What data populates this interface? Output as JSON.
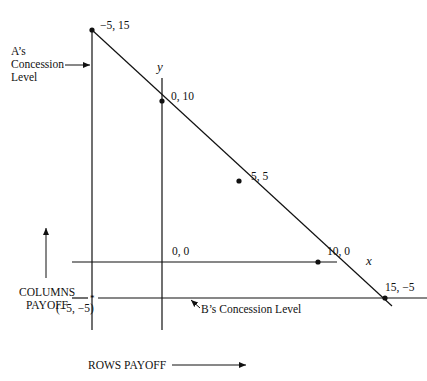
{
  "diagram": {
    "type": "payoff-diagram",
    "axes": {
      "x_label": "x",
      "y_label": "y",
      "horizontal_caption": "ROWS PAYOFF",
      "vertical_caption_line1": "COLUMNS",
      "vertical_caption_line2": "PAYOFF"
    },
    "points": [
      {
        "label": "−5, 15",
        "x": -5,
        "y": 15
      },
      {
        "label": "0, 10",
        "x": 0,
        "y": 10
      },
      {
        "label": "5, 5",
        "x": 5,
        "y": 5
      },
      {
        "label": "10, 0",
        "x": 10,
        "y": 0
      },
      {
        "label": "15, −5",
        "x": 15,
        "y": -5
      }
    ],
    "origin_label": "0, 0",
    "concession_point_label": "(−5, −5)",
    "annotations": {
      "a_concession_line1": "A’s",
      "a_concession_line2": "Concession",
      "a_concession_line3": "Level",
      "b_concession": "B’s Concession Level"
    },
    "colors": {
      "line": "#111111",
      "background": "#ffffff"
    }
  }
}
